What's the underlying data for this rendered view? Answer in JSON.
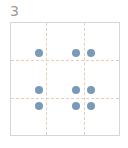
{
  "card": {
    "label": "3",
    "dot_color": "#7a9ab8",
    "grid": {
      "rows": 3,
      "cols": 3
    },
    "dots": [
      {
        "x": 39,
        "y": 53
      },
      {
        "x": 76,
        "y": 53
      },
      {
        "x": 91,
        "y": 53
      },
      {
        "x": 39,
        "y": 90
      },
      {
        "x": 76,
        "y": 90
      },
      {
        "x": 91,
        "y": 90
      },
      {
        "x": 39,
        "y": 106
      },
      {
        "x": 76,
        "y": 106
      },
      {
        "x": 91,
        "y": 106
      }
    ]
  }
}
